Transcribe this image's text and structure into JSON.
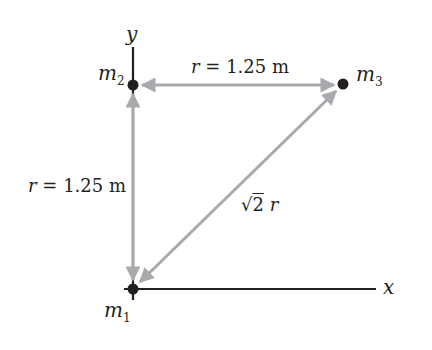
{
  "diagram": {
    "axes": {
      "x_label": "x",
      "y_label": "y"
    },
    "masses": [
      {
        "id": "m1",
        "symbol": "m",
        "subscript": "1",
        "position": "origin"
      },
      {
        "id": "m2",
        "symbol": "m",
        "subscript": "2",
        "position": "on y-axis"
      },
      {
        "id": "m3",
        "symbol": "m",
        "subscript": "3",
        "position": "upper right"
      }
    ],
    "distances": {
      "m2_m3": {
        "var": "r",
        "eq": " = 1.25 m"
      },
      "m1_m2": {
        "var": "r",
        "eq": " = 1.25 m"
      },
      "m1_m3": {
        "sqrt": "2",
        "var": "r"
      }
    },
    "colors": {
      "arrow": "#a7a9ac",
      "axis": "#231f20",
      "dot": "#231f20",
      "text": "#231f20"
    }
  }
}
